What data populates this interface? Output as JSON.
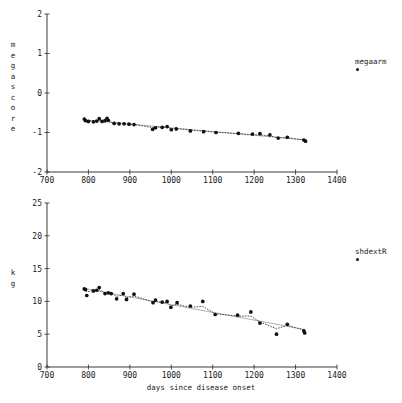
{
  "figure": {
    "xlabel": "days since disease onset"
  },
  "panels": [
    {
      "id": "megascore-panel",
      "ylabel": "megascore",
      "ylabel_letters": [
        "m",
        "e",
        "g",
        "a",
        "s",
        "c",
        "o",
        "r",
        "e"
      ],
      "legend_label": "megaarm",
      "legend_marker": "filled-circle"
    },
    {
      "id": "shdextr-panel",
      "ylabel": "kg",
      "ylabel_letters": [
        "k",
        "g"
      ],
      "legend_label": "shdextR",
      "legend_marker": "filled-circle"
    }
  ],
  "chart_data": [
    {
      "type": "scatter",
      "title": "",
      "name": "megaarm",
      "xlabel": "",
      "ylabel": "megascore",
      "xlim": [
        700,
        1400
      ],
      "ylim": [
        -2,
        2
      ],
      "xticks": [
        700,
        800,
        900,
        1000,
        1100,
        1200,
        1300,
        1400
      ],
      "yticks": [
        -2,
        -1,
        0,
        1,
        2
      ],
      "grid": false,
      "legend_position": "right-outside",
      "legend": [
        "megaarm"
      ],
      "marker": "filled-circle",
      "has_fit_line": true,
      "fit_line_style": "dotted-thin",
      "points": [
        {
          "x": 790,
          "y": -0.66
        },
        {
          "x": 793,
          "y": -0.7
        },
        {
          "x": 800,
          "y": -0.72
        },
        {
          "x": 812,
          "y": -0.73
        },
        {
          "x": 820,
          "y": -0.71
        },
        {
          "x": 826,
          "y": -0.65
        },
        {
          "x": 833,
          "y": -0.72
        },
        {
          "x": 840,
          "y": -0.7
        },
        {
          "x": 845,
          "y": -0.64
        },
        {
          "x": 848,
          "y": -0.69
        },
        {
          "x": 862,
          "y": -0.77
        },
        {
          "x": 874,
          "y": -0.78
        },
        {
          "x": 886,
          "y": -0.78
        },
        {
          "x": 898,
          "y": -0.79
        },
        {
          "x": 910,
          "y": -0.8
        },
        {
          "x": 955,
          "y": -0.92
        },
        {
          "x": 962,
          "y": -0.88
        },
        {
          "x": 978,
          "y": -0.87
        },
        {
          "x": 990,
          "y": -0.85
        },
        {
          "x": 1000,
          "y": -0.93
        },
        {
          "x": 1012,
          "y": -0.91
        },
        {
          "x": 1046,
          "y": -0.96
        },
        {
          "x": 1078,
          "y": -0.98
        },
        {
          "x": 1108,
          "y": -1.0
        },
        {
          "x": 1162,
          "y": -1.02
        },
        {
          "x": 1196,
          "y": -1.04
        },
        {
          "x": 1214,
          "y": -1.03
        },
        {
          "x": 1238,
          "y": -1.06
        },
        {
          "x": 1258,
          "y": -1.14
        },
        {
          "x": 1280,
          "y": -1.12
        },
        {
          "x": 1320,
          "y": -1.19
        },
        {
          "x": 1324,
          "y": -1.22
        }
      ]
    },
    {
      "type": "scatter",
      "title": "",
      "name": "shdextR",
      "xlabel": "days since disease onset",
      "ylabel": "kg",
      "xlim": [
        700,
        1400
      ],
      "ylim": [
        0,
        25
      ],
      "xticks": [
        700,
        800,
        900,
        1000,
        1100,
        1200,
        1300,
        1400
      ],
      "yticks": [
        0,
        5,
        10,
        15,
        20,
        25
      ],
      "grid": false,
      "legend_position": "right-outside",
      "legend": [
        "shdextR"
      ],
      "marker": "filled-circle",
      "has_fit_line": true,
      "fit_line_style": "dotted-thin",
      "points": [
        {
          "x": 790,
          "y": 11.9
        },
        {
          "x": 793,
          "y": 11.8
        },
        {
          "x": 796,
          "y": 10.9
        },
        {
          "x": 812,
          "y": 11.6
        },
        {
          "x": 820,
          "y": 11.7
        },
        {
          "x": 826,
          "y": 12.1
        },
        {
          "x": 840,
          "y": 11.2
        },
        {
          "x": 848,
          "y": 11.3
        },
        {
          "x": 855,
          "y": 11.2
        },
        {
          "x": 868,
          "y": 10.4
        },
        {
          "x": 884,
          "y": 11.2
        },
        {
          "x": 892,
          "y": 10.3
        },
        {
          "x": 910,
          "y": 11.1
        },
        {
          "x": 956,
          "y": 9.8
        },
        {
          "x": 962,
          "y": 10.2
        },
        {
          "x": 978,
          "y": 9.9
        },
        {
          "x": 990,
          "y": 10.0
        },
        {
          "x": 999,
          "y": 9.1
        },
        {
          "x": 1014,
          "y": 9.8
        },
        {
          "x": 1046,
          "y": 9.3
        },
        {
          "x": 1076,
          "y": 10.0
        },
        {
          "x": 1106,
          "y": 8.0
        },
        {
          "x": 1160,
          "y": 7.9
        },
        {
          "x": 1192,
          "y": 8.4
        },
        {
          "x": 1214,
          "y": 6.7
        },
        {
          "x": 1254,
          "y": 5.0
        },
        {
          "x": 1280,
          "y": 6.5
        },
        {
          "x": 1320,
          "y": 5.5
        },
        {
          "x": 1322,
          "y": 5.2
        }
      ]
    }
  ]
}
